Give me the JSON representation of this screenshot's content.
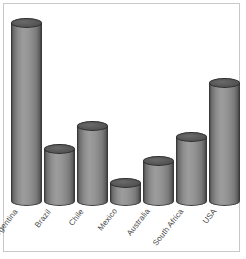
{
  "chart_data": {
    "type": "bar",
    "title": "",
    "subtitle": "",
    "xlabel": "",
    "ylabel": "",
    "categories": [
      "Argentina",
      "Brazil",
      "Chile",
      "Mexico",
      "Australia",
      "South Africa",
      "USA"
    ],
    "values": [
      186,
      54,
      79,
      19,
      42,
      67,
      124
    ],
    "ylim": [
      0,
      200
    ],
    "grid": false,
    "legend": null,
    "legend_position": "none",
    "style": "3d-cylinder",
    "annotations": [],
    "series": [
      {
        "name": "",
        "values": [
          186,
          54,
          79,
          19,
          42,
          67,
          124
        ]
      }
    ]
  },
  "colors": {
    "cylinder_light": "#9c9c9c",
    "cylinder_mid": "#8a8a8a",
    "cylinder_dark": "#414141",
    "cylinder_top": "#5a5a5a",
    "outline": "#3a3a3a",
    "frame": "#c9c9c9",
    "background": "#ffffff",
    "label_text": "#4a4a4a"
  },
  "layout": {
    "baseline_y": 201,
    "plot_left": 11,
    "bar_width": 31,
    "bar_gap": 2,
    "label_rotation_deg": -52
  }
}
